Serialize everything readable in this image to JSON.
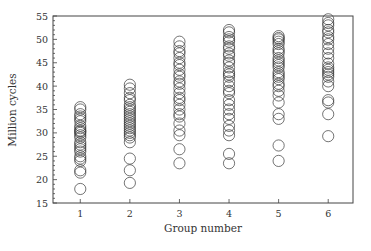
{
  "chart_data": {
    "type": "scatter",
    "title": "",
    "xlabel": "Group number",
    "ylabel": "Million cycles",
    "x_ticks": [
      1,
      2,
      3,
      4,
      5,
      6
    ],
    "y_ticks": [
      15,
      20,
      25,
      30,
      35,
      40,
      45,
      50,
      55
    ],
    "xlim": [
      0.45,
      6.5
    ],
    "ylim": [
      15,
      55
    ],
    "grid": false,
    "legend": null,
    "marker": "open-circle",
    "marker_color": "#333333",
    "series": [
      {
        "name": "Group 1",
        "x": 1,
        "values": [
          35.5,
          35,
          34,
          33.5,
          33,
          32.5,
          31.5,
          31,
          30.5,
          30.3,
          30,
          29.5,
          29,
          28,
          27.5,
          27,
          26.5,
          26,
          25,
          24.5,
          24,
          22,
          21.5,
          18
        ]
      },
      {
        "name": "Group 2",
        "x": 2,
        "values": [
          40.3,
          39.5,
          38.5,
          37.5,
          37,
          36,
          35.5,
          35,
          34.5,
          34,
          33.5,
          33,
          32.5,
          32,
          31.5,
          31,
          30.5,
          30,
          29.5,
          29,
          28,
          24.5,
          22,
          19.3
        ]
      },
      {
        "name": "Group 3",
        "x": 3,
        "values": [
          49.5,
          48.5,
          47.5,
          47,
          46,
          45,
          44.5,
          43.5,
          42.5,
          42,
          41,
          40.5,
          39.5,
          38.5,
          37.5,
          37,
          36,
          35,
          34,
          33.5,
          32,
          30.5,
          29.5,
          26.5,
          23.5
        ]
      },
      {
        "name": "Group 4",
        "x": 4,
        "values": [
          52,
          51.5,
          50.5,
          50,
          49.5,
          48.5,
          48,
          47,
          46.5,
          45.5,
          45,
          44,
          43,
          42.5,
          42,
          41,
          40,
          39,
          38.5,
          37,
          36,
          35,
          34,
          33,
          31.5,
          30.5,
          29.5,
          25.5,
          23.5
        ]
      },
      {
        "name": "Group 5",
        "x": 5,
        "values": [
          50.7,
          50.3,
          50,
          49.5,
          49,
          48,
          47.5,
          47,
          46,
          45.5,
          45,
          44.5,
          44,
          43,
          42.5,
          42,
          41.5,
          40.5,
          40,
          39,
          38,
          36.5,
          34,
          33,
          27.3,
          24
        ]
      },
      {
        "name": "Group 6",
        "x": 6,
        "values": [
          54.3,
          53.5,
          53,
          52,
          51.5,
          50.5,
          50,
          49,
          48,
          47,
          46,
          44.8,
          44,
          43.5,
          43,
          42.5,
          42,
          41,
          40,
          37,
          36.5,
          34,
          29.3
        ]
      }
    ]
  }
}
